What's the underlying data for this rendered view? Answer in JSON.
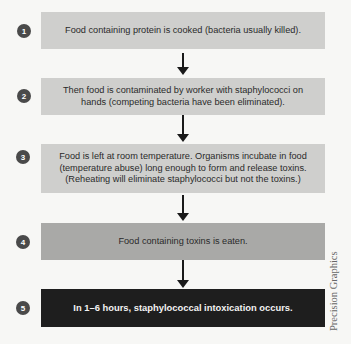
{
  "steps": [
    {
      "number": "1",
      "text": "Food containing protein is cooked (bacteria usually killed)."
    },
    {
      "number": "2",
      "text": "Then food is contaminated by worker with staphylococci on hands (competing bacteria have been eliminated)."
    },
    {
      "number": "3",
      "text": "Food is left at room temperature. Organisms incubate in food (temperature abuse) long enough to form and release toxins. (Reheating will eliminate staphylococci but not the toxins.)"
    },
    {
      "number": "4",
      "text": "Food containing toxins is eaten."
    },
    {
      "number": "5",
      "text": "In 1–6 hours, staphylococcal intoxication occurs."
    }
  ],
  "credit": "Precision Graphics",
  "colors": {
    "box_light": "#cfcfcd",
    "box_mid": "#a9a9a7",
    "box_dark": "#1e1e1e",
    "number_circle": "#4a4a4a",
    "arrow": "#1a1a1a"
  }
}
